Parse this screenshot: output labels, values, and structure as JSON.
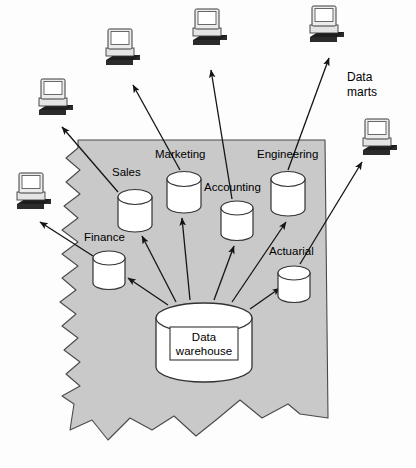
{
  "diagram": {
    "title_labels": {
      "data_marts": "Data\nmarts",
      "data_marts_line1": "Data",
      "data_marts_line2": "marts",
      "warehouse_line1": "Data",
      "warehouse_line2": "warehouse"
    },
    "colors": {
      "region_fill": "#c9c9c9",
      "region_stroke": "#4a4a4a",
      "cylinder_fill": "#ffffff",
      "cylinder_stroke": "#333333",
      "arrow_stroke": "#1a1a1a",
      "monitor_body": "#e8e8e8",
      "monitor_screen": "#ffffff",
      "keyboard_dark": "#2b2b2b",
      "text": "#000000"
    },
    "departments": [
      {
        "name": "Sales",
        "label_x": 112,
        "label_y": 166,
        "cyl_x": 118,
        "cyl_y": 188,
        "cyl_w": 34,
        "cyl_h": 42
      },
      {
        "name": "Marketing",
        "label_x": 155,
        "label_y": 148,
        "cyl_x": 167,
        "cyl_y": 170,
        "cyl_w": 34,
        "cyl_h": 42
      },
      {
        "name": "Accounting",
        "label_x": 204,
        "label_y": 181,
        "cyl_x": 221,
        "cyl_y": 199,
        "cyl_w": 32,
        "cyl_h": 40
      },
      {
        "name": "Engineering",
        "label_x": 257,
        "label_y": 148,
        "cyl_x": 271,
        "cyl_y": 170,
        "cyl_w": 34,
        "cyl_h": 46
      },
      {
        "name": "Finance",
        "label_x": 84,
        "label_y": 231,
        "cyl_x": 93,
        "cyl_y": 249,
        "cyl_w": 32,
        "cyl_h": 40
      },
      {
        "name": "Actuarial",
        "label_x": 269,
        "label_y": 245,
        "cyl_x": 278,
        "cyl_y": 264,
        "cyl_w": 32,
        "cyl_h": 38
      }
    ],
    "warehouse": {
      "name": "Data warehouse",
      "cyl_x": 156,
      "cyl_y": 303,
      "cyl_w": 96,
      "cyl_h": 78
    },
    "workstations": [
      {
        "id": "workstation-sales",
        "x": 33,
        "y": 78
      },
      {
        "id": "workstation-finance",
        "x": 11,
        "y": 172
      },
      {
        "id": "workstation-marketing",
        "x": 100,
        "y": 28
      },
      {
        "id": "workstation-accounting",
        "x": 187,
        "y": 8
      },
      {
        "id": "workstation-engineering",
        "x": 304,
        "y": 5
      },
      {
        "id": "workstation-actuarial",
        "x": 357,
        "y": 118
      }
    ]
  }
}
